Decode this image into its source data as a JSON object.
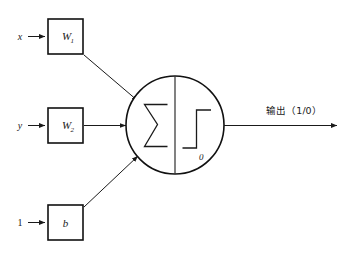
{
  "diagram": {
    "type": "perceptron-neuron",
    "background_color": "#ffffff",
    "stroke_color": "#1a1a1a",
    "inputs": [
      {
        "source_label": "x",
        "weight_label": "W",
        "weight_subscript": "1"
      },
      {
        "source_label": "y",
        "weight_label": "W",
        "weight_subscript": "2"
      },
      {
        "source_label": "1",
        "weight_label": "b",
        "weight_subscript": ""
      }
    ],
    "neuron": {
      "sum_symbol": "Σ",
      "activation": "step-function",
      "threshold_label": "0"
    },
    "output": {
      "label": "输出（1/0）"
    }
  }
}
